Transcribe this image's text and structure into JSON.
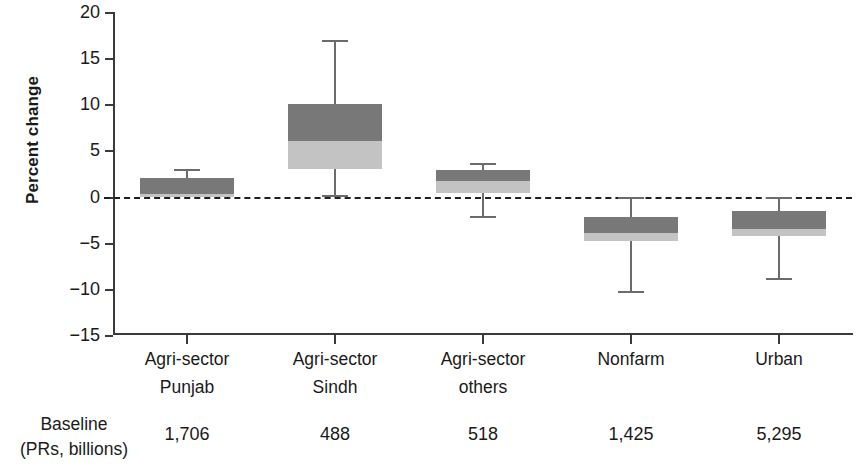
{
  "chart_data": {
    "type": "bar",
    "title": "",
    "xlabel": "",
    "ylabel": "Percent change",
    "ylim": [
      -15,
      20
    ],
    "yticks": [
      20,
      15,
      10,
      5,
      0,
      -5,
      -10,
      -15
    ],
    "ytick_labels": [
      "20",
      "15",
      "10",
      "5",
      "0",
      "−15",
      "−10",
      "−5"
    ],
    "grid": false,
    "legend": "none",
    "zero_reference_line": true,
    "categories": [
      "Agri-sector Punjab",
      "Agri-sector Sindh",
      "Agri-sector others",
      "Nonfarm",
      "Urban"
    ],
    "boxes": [
      {
        "label_line1": "Agri-sector",
        "label_line2": "Punjab",
        "box_low": 0.0,
        "box_split": 0.3,
        "box_high": 2.0,
        "whisker_low": 0.0,
        "whisker_high": 3.0,
        "baseline": "1,706"
      },
      {
        "label_line1": "Agri-sector",
        "label_line2": "Sindh",
        "box_low": 3.0,
        "box_split": 6.0,
        "box_high": 10.0,
        "whisker_low": 0.0,
        "whisker_high": 17.0,
        "baseline": "488"
      },
      {
        "label_line1": "Agri-sector",
        "label_line2": "others",
        "box_low": 0.4,
        "box_split": 1.7,
        "box_high": 2.9,
        "whisker_low": -2.3,
        "whisker_high": 3.6,
        "baseline": "518"
      },
      {
        "label_line1": "Nonfarm",
        "label_line2": "",
        "box_low": -4.8,
        "box_split": -4.0,
        "box_high": -2.2,
        "whisker_low": -10.5,
        "whisker_high": 0.0,
        "baseline": "1,425"
      },
      {
        "label_line1": "Urban",
        "label_line2": "",
        "box_low": -4.3,
        "box_split": -3.5,
        "box_high": -1.6,
        "whisker_low": -9.0,
        "whisker_high": 0.0,
        "baseline": "5,295"
      }
    ],
    "colors": {
      "box_upper": "#787878",
      "box_lower": "#c3c3c3",
      "axis": "#3a3a3a",
      "whisker": "#6b6b6b",
      "zero_line": "#1f1f1f",
      "background": "#ffffff"
    }
  },
  "baseline_row": {
    "label_line1": "Baseline",
    "label_line2": "(PRs, billions)",
    "values": [
      "1,706",
      "488",
      "518",
      "1,425",
      "5,295"
    ]
  }
}
